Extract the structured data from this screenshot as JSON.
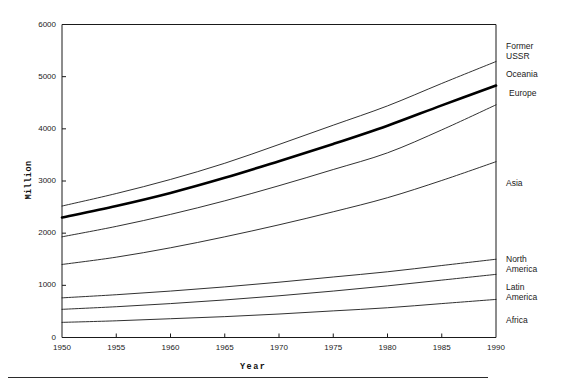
{
  "chart_data": {
    "type": "line",
    "title": "",
    "xlabel": "Year",
    "ylabel": "Million",
    "xlim": [
      1950,
      1990
    ],
    "ylim": [
      0,
      6000
    ],
    "grid": false,
    "legend_position": "right-of-axis",
    "x": [
      1950,
      1955,
      1960,
      1965,
      1970,
      1975,
      1980,
      1985,
      1990
    ],
    "xticks": [
      "1950",
      "1955",
      "1960",
      "1965",
      "1970",
      "1975",
      "1980",
      "1985",
      "1990"
    ],
    "yticks": [
      "0",
      "1000",
      "2000",
      "3000",
      "4000",
      "5000",
      "6000"
    ],
    "series": [
      {
        "name": "Former USSR",
        "emphasis": "thin",
        "values": [
          2520,
          2760,
          3030,
          3340,
          3700,
          4070,
          4440,
          4870,
          5290
        ]
      },
      {
        "name": "Oceania",
        "emphasis": "bold",
        "values": [
          2300,
          2520,
          2770,
          3060,
          3380,
          3710,
          4060,
          4450,
          4830
        ]
      },
      {
        "name": "Europe",
        "emphasis": "thin",
        "values": [
          1930,
          2130,
          2360,
          2620,
          2910,
          3220,
          3540,
          3980,
          4460
        ]
      },
      {
        "name": "Asia",
        "emphasis": "thin",
        "values": [
          1400,
          1540,
          1720,
          1930,
          2160,
          2410,
          2680,
          3010,
          3370
        ]
      },
      {
        "name": "North America",
        "emphasis": "thin",
        "values": [
          760,
          820,
          890,
          970,
          1060,
          1160,
          1260,
          1380,
          1500
        ]
      },
      {
        "name": "Latin America",
        "emphasis": "thin",
        "values": [
          540,
          590,
          650,
          720,
          800,
          890,
          990,
          1100,
          1210
        ]
      },
      {
        "name": "Africa",
        "emphasis": "thin",
        "values": [
          290,
          320,
          360,
          400,
          450,
          510,
          570,
          650,
          730
        ]
      }
    ],
    "colors": {
      "axis": "#1a1a1a",
      "line": "#1a1a1a",
      "bold_line": "#000000",
      "background": "#ffffff"
    }
  },
  "labels": {
    "former_ussr_line1": "Former",
    "former_ussr_line2": "USSR",
    "oceania": "Oceania",
    "europe": "Europe",
    "asia": "Asia",
    "north_america_line1": "North",
    "north_america_line2": "America",
    "latin_america_line1": "Latin",
    "latin_america_line2": "America",
    "africa": "Africa"
  }
}
